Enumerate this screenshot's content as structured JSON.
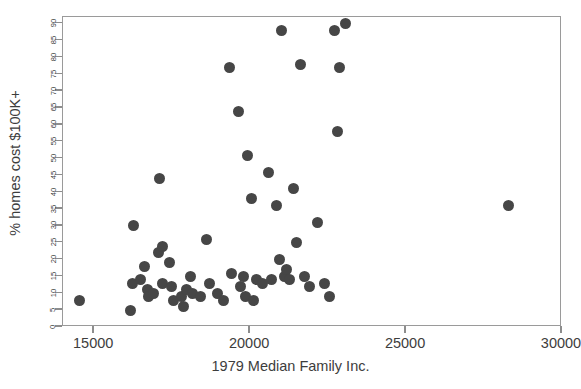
{
  "chart_data": {
    "type": "scatter",
    "title": "",
    "xlabel": "1979 Median Family Inc.",
    "ylabel": "% homes cost $100K+",
    "xlim": [
      14000,
      30000
    ],
    "ylim": [
      0,
      92
    ],
    "grid": false,
    "legend": null,
    "marker_color": "#464646",
    "marker_shape": "circle",
    "xticks": [
      15000,
      20000,
      25000,
      30000
    ],
    "xtick_labels": [
      "15000",
      "20000",
      "25000",
      "30000"
    ],
    "yticks": [
      0,
      5,
      10,
      15,
      20,
      25,
      30,
      35,
      40,
      45,
      50,
      55,
      60,
      65,
      70,
      75,
      80,
      85,
      90
    ],
    "ytick_labels": [
      "0",
      "5",
      "10",
      "15",
      "20",
      "25",
      "30",
      "35",
      "40",
      "45",
      "50",
      "55",
      "60",
      "65",
      "70",
      "75",
      "80",
      "85",
      "90"
    ],
    "n_points": 58,
    "points": [
      {
        "x": 14530,
        "y": 8
      },
      {
        "x": 16170,
        "y": 5
      },
      {
        "x": 16230,
        "y": 13
      },
      {
        "x": 16250,
        "y": 30
      },
      {
        "x": 16480,
        "y": 14
      },
      {
        "x": 16620,
        "y": 18
      },
      {
        "x": 16700,
        "y": 11
      },
      {
        "x": 16750,
        "y": 9
      },
      {
        "x": 16900,
        "y": 10
      },
      {
        "x": 17050,
        "y": 22
      },
      {
        "x": 17080,
        "y": 44
      },
      {
        "x": 17180,
        "y": 24
      },
      {
        "x": 17200,
        "y": 13
      },
      {
        "x": 17400,
        "y": 19
      },
      {
        "x": 17480,
        "y": 12
      },
      {
        "x": 17530,
        "y": 8
      },
      {
        "x": 17800,
        "y": 9
      },
      {
        "x": 17870,
        "y": 6
      },
      {
        "x": 17950,
        "y": 11
      },
      {
        "x": 18080,
        "y": 15
      },
      {
        "x": 18150,
        "y": 10
      },
      {
        "x": 18400,
        "y": 9
      },
      {
        "x": 18600,
        "y": 26
      },
      {
        "x": 18700,
        "y": 13
      },
      {
        "x": 18950,
        "y": 10
      },
      {
        "x": 19150,
        "y": 8
      },
      {
        "x": 19350,
        "y": 77
      },
      {
        "x": 19400,
        "y": 16
      },
      {
        "x": 19620,
        "y": 64
      },
      {
        "x": 19700,
        "y": 12
      },
      {
        "x": 19780,
        "y": 15
      },
      {
        "x": 19850,
        "y": 9
      },
      {
        "x": 19900,
        "y": 51
      },
      {
        "x": 20050,
        "y": 38
      },
      {
        "x": 20100,
        "y": 8
      },
      {
        "x": 20200,
        "y": 14
      },
      {
        "x": 20400,
        "y": 13
      },
      {
        "x": 20600,
        "y": 46
      },
      {
        "x": 20700,
        "y": 14
      },
      {
        "x": 20850,
        "y": 36
      },
      {
        "x": 20950,
        "y": 20
      },
      {
        "x": 21000,
        "y": 88
      },
      {
        "x": 21100,
        "y": 15
      },
      {
        "x": 21180,
        "y": 17
      },
      {
        "x": 21250,
        "y": 14
      },
      {
        "x": 21400,
        "y": 41
      },
      {
        "x": 21500,
        "y": 25
      },
      {
        "x": 21600,
        "y": 78
      },
      {
        "x": 21750,
        "y": 15
      },
      {
        "x": 21900,
        "y": 12
      },
      {
        "x": 22150,
        "y": 31
      },
      {
        "x": 22400,
        "y": 13
      },
      {
        "x": 22550,
        "y": 9
      },
      {
        "x": 22700,
        "y": 88
      },
      {
        "x": 22800,
        "y": 58
      },
      {
        "x": 22850,
        "y": 77
      },
      {
        "x": 23050,
        "y": 90
      },
      {
        "x": 28300,
        "y": 36
      }
    ]
  },
  "axis": {
    "y_title": "% homes cost $100K+",
    "x_title": "1979 Median Family Inc."
  }
}
